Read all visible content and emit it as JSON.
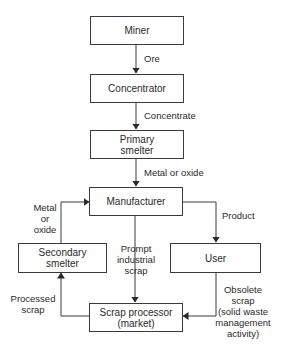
{
  "diagram": {
    "title": "",
    "nodes": {
      "miner": "Miner",
      "concentrator": "Concentrator",
      "primary_smelter": "Primary\nsmelter",
      "manufacturer": "Manufacturer",
      "secondary_smelter": "Secondary\nsmelter",
      "user": "User",
      "scrap_processor": "Scrap processor\n(market)"
    },
    "edges": {
      "ore": "Ore",
      "concentrate": "Concentrate",
      "metal_or_oxide_primary": "Metal or oxide",
      "metal_or_oxide_secondary": "Metal\nor\noxide",
      "product": "Product",
      "prompt_industrial_scrap": "Prompt\nindustrial\nscrap",
      "processed_scrap": "Processed\nscrap",
      "obsolete_scrap": "Obsolete\nscrap\n(solid waste\nmanagement\nactivity)"
    },
    "colors": {
      "line": "#3a3a3a",
      "text": "#2a2a2a",
      "background": "#ffffff"
    }
  }
}
